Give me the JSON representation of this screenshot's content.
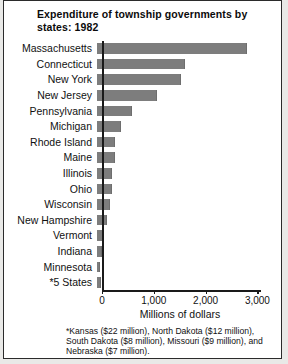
{
  "figure": {
    "title": "Expenditure of township governments by states:  1982",
    "xlabel": "Millions of dollars",
    "footnote": "*Kansas ($22 million), North Dakota ($12 million), South Dakota ($8 million), Missouri ($9 million), and Nebraska ($7 million)."
  },
  "chart_data": {
    "type": "bar",
    "orientation": "horizontal",
    "title": "Expenditure of township governments by states:  1982",
    "xlabel": "Millions of dollars",
    "ylabel": "",
    "xlim": [
      0,
      3200
    ],
    "grid": false,
    "legend": false,
    "bar_color": "#7d7d7d",
    "tick_labels": [
      "0",
      "1,000",
      "2,000",
      "3,000"
    ],
    "tick_values": [
      0,
      1000,
      2000,
      3000
    ],
    "categories": [
      "Massachusetts",
      "Connecticut",
      "New York",
      "New Jersey",
      "Pennsylvania",
      "Michigan",
      "Rhode Island",
      "Maine",
      "Illinois",
      "Ohio",
      "Wisconsin",
      "New Hampshire",
      "Vermont",
      "Indiana",
      "Minnesota",
      "*5 States"
    ],
    "values": [
      2900,
      1700,
      1620,
      1150,
      680,
      470,
      350,
      340,
      290,
      285,
      260,
      200,
      110,
      100,
      65,
      80
    ],
    "annotations": [
      "*Kansas ($22 million), North Dakota ($12 million), South Dakota ($8 million), Missouri ($9 million), and Nebraska ($7 million)."
    ]
  }
}
